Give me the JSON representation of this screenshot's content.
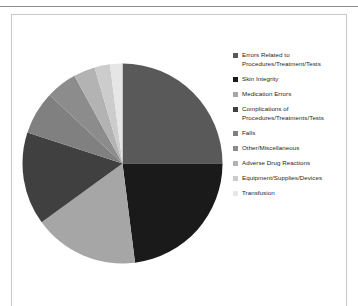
{
  "page": {
    "clipped_header_text": "",
    "background_color": "#ffffff"
  },
  "chart_data": {
    "type": "pie",
    "title": "",
    "subtitle": "",
    "xlabel": "",
    "ylabel": "",
    "legend_position": "right",
    "grid": false,
    "start_angle_deg": 0,
    "direction": "clockwise",
    "categories": [
      "Errors Related to Procedures/Treatment/Tests",
      "Skin Integrity",
      "Medication Errors",
      "Complications of Procedures/Treatments/Tests",
      "Falls",
      "Other/Miscellaneous",
      "Adverse Drug Reactions",
      "Equipment/Supplies/Devices",
      "Transfusion"
    ],
    "values": [
      25.0,
      23.0,
      17.0,
      15.0,
      7.0,
      5.0,
      3.5,
      2.5,
      2.0
    ],
    "colors": [
      "#595959",
      "#1a1a1a",
      "#a6a6a6",
      "#404040",
      "#808080",
      "#8c8c8c",
      "#b3b3b3",
      "#cccccc",
      "#e6e6e6"
    ]
  },
  "legend": {
    "items": [
      {
        "label": "Errors Related to Procedures/Treatment/Tests",
        "line1": "Errors Related to",
        "line2": "Procedures/Treatment/Tests",
        "color": "#595959"
      },
      {
        "label": "Skin Integrity",
        "line1": "Skin Integrity",
        "line2": "",
        "color": "#1a1a1a"
      },
      {
        "label": "Medication Errors",
        "line1": "Medication Errors",
        "line2": "",
        "color": "#a6a6a6"
      },
      {
        "label": "Complications of Procedures/Treatments/Tests",
        "line1": "Complications of",
        "line2": "Procedures/Treatments/Tests",
        "color": "#404040"
      },
      {
        "label": "Falls",
        "line1": "Falls",
        "line2": "",
        "color": "#808080"
      },
      {
        "label": "Other/Miscellaneous",
        "line1": "Other/Miscellaneous",
        "line2": "",
        "color": "#8c8c8c"
      },
      {
        "label": "Adverse Drug Reactions",
        "line1": "Adverse Drug Reactions",
        "line2": "",
        "color": "#b3b3b3"
      },
      {
        "label": "Equipment/Supplies/Devices",
        "line1": "Equipment/Supplies/Devices",
        "line2": "",
        "color": "#cccccc"
      },
      {
        "label": "Transfusion",
        "line1": "Transfusion",
        "line2": "",
        "color": "#e6e6e6"
      }
    ]
  }
}
